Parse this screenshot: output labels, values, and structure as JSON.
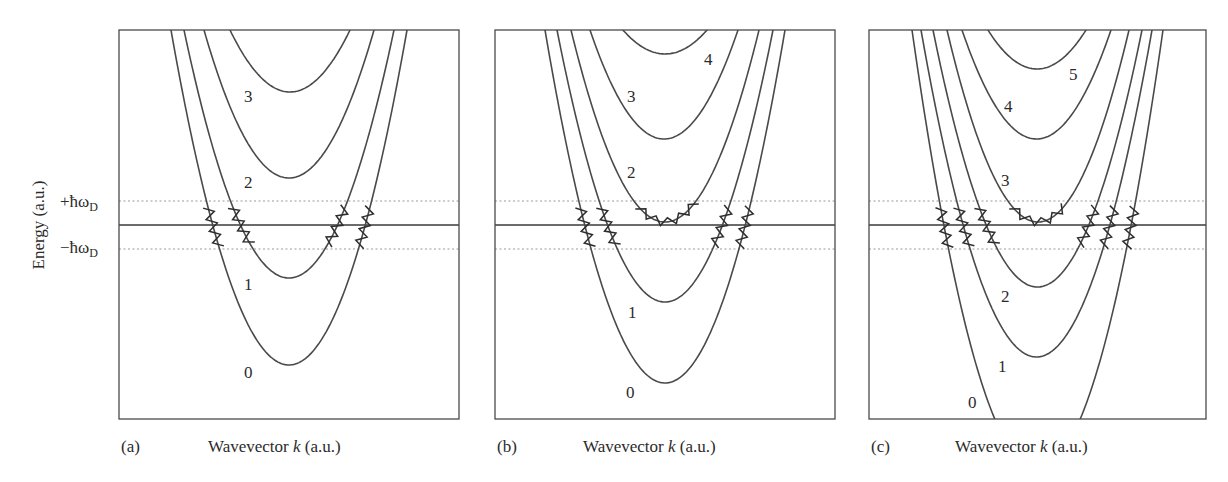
{
  "figure": {
    "ylabel": "Energy (a.u.)",
    "energy_marks": {
      "plus": "+ħω",
      "minus": "−ħω",
      "sub": "D"
    },
    "panels": [
      {
        "tag": "(a)",
        "xlabel_pre": "Wavevector ",
        "xlabel_k": "k",
        "xlabel_post": " (a.u.)"
      },
      {
        "tag": "(b)",
        "xlabel_pre": "Wavevector ",
        "xlabel_k": "k",
        "xlabel_post": " (a.u.)"
      },
      {
        "tag": "(c)",
        "xlabel_pre": "Wavevector ",
        "xlabel_k": "k",
        "xlabel_post": " (a.u.)"
      }
    ]
  },
  "colors": {
    "curve": "#4a4a4a",
    "frame": "#4a4a4a",
    "band": "#9a9a9a",
    "text": "#2b2b2b"
  },
  "chart_data": [
    {
      "type": "line",
      "panel": "(a)",
      "title": "",
      "xlabel": "Wavevector k (a.u.)",
      "ylabel": "Energy (a.u.)",
      "grid": false,
      "ytick_labels": [
        "+ħωD",
        "−ħωD"
      ],
      "reference_lines": {
        "fermi_level": 0,
        "debye_window": [
          "-ħωD",
          "+ħωD"
        ]
      },
      "series": [
        {
          "name": "0",
          "subband_index": 0,
          "min_energy_rel": -1.0
        },
        {
          "name": "1",
          "subband_index": 1,
          "min_energy_rel": -0.3
        },
        {
          "name": "2",
          "subband_index": 2,
          "min_energy_rel": 0.5
        },
        {
          "name": "3",
          "subband_index": 3,
          "min_energy_rel": 1.2
        }
      ],
      "geometry": {
        "frame": [
          119,
          30,
          459,
          419
        ],
        "cx": 289,
        "fermi_y": 225,
        "plus_y": 201,
        "minus_y": 249,
        "curves": [
          {
            "label": "0",
            "ymin": 365,
            "xl": 171,
            "xr": 407,
            "lx": 244,
            "ly": 378
          },
          {
            "label": "1",
            "ymin": 278,
            "xl": 184,
            "xr": 394,
            "lx": 244,
            "ly": 290
          },
          {
            "label": "2",
            "ymin": 178,
            "xl": 204,
            "xr": 374,
            "lx": 244,
            "ly": 188
          },
          {
            "label": "3",
            "ymin": 92,
            "xl": 230,
            "xr": 350,
            "lx": 244,
            "ly": 102
          }
        ],
        "zigzag_curves": [
          0,
          1
        ],
        "bottom_zigzag": null
      }
    },
    {
      "type": "line",
      "panel": "(b)",
      "title": "",
      "xlabel": "Wavevector k (a.u.)",
      "ylabel": "Energy (a.u.)",
      "grid": false,
      "reference_lines": {
        "fermi_level": 0,
        "debye_window": [
          "-ħωD",
          "+ħωD"
        ]
      },
      "series": [
        {
          "name": "0",
          "subband_index": 0
        },
        {
          "name": "1",
          "subband_index": 1
        },
        {
          "name": "2",
          "subband_index": 2,
          "minimum_in_debye_window": true
        },
        {
          "name": "3",
          "subband_index": 3
        },
        {
          "name": "4",
          "subband_index": 4
        }
      ],
      "geometry": {
        "frame": [
          495,
          30,
          835,
          419
        ],
        "cx": 667,
        "fermi_y": 225,
        "plus_y": 201,
        "minus_y": 249,
        "curves": [
          {
            "label": "0",
            "ymin": 383,
            "xl": 545,
            "xr": 785,
            "lx": 626,
            "ly": 398
          },
          {
            "label": "1",
            "ymin": 302,
            "xl": 557,
            "xr": 773,
            "lx": 628,
            "ly": 318
          },
          {
            "label": "2",
            "ymin": 222,
            "xl": 571,
            "xr": 759,
            "lx": 627,
            "ly": 178
          },
          {
            "label": "3",
            "ymin": 139,
            "xl": 590,
            "xr": 738,
            "lx": 627,
            "ly": 102
          },
          {
            "label": "4",
            "ymin": 54,
            "xl": 623,
            "xr": 707,
            "lx": 704,
            "ly": 65
          }
        ],
        "zigzag_curves": [
          0,
          1
        ],
        "bottom_zigzag": 2
      }
    },
    {
      "type": "line",
      "panel": "(c)",
      "title": "",
      "xlabel": "Wavevector k (a.u.)",
      "ylabel": "Energy (a.u.)",
      "grid": false,
      "reference_lines": {
        "fermi_level": 0,
        "debye_window": [
          "-ħωD",
          "+ħωD"
        ]
      },
      "series": [
        {
          "name": "0",
          "subband_index": 0
        },
        {
          "name": "1",
          "subband_index": 1
        },
        {
          "name": "2",
          "subband_index": 2
        },
        {
          "name": "3",
          "subband_index": 3,
          "minimum_in_debye_window": true
        },
        {
          "name": "4",
          "subband_index": 4
        },
        {
          "name": "5",
          "subband_index": 5
        }
      ],
      "geometry": {
        "frame": [
          869,
          30,
          1206,
          419
        ],
        "cx": 1036,
        "fermi_y": 225,
        "plus_y": 201,
        "minus_y": 249,
        "curves": [
          {
            "label": "0",
            "ymin": 470,
            "xl": 912,
            "xr": 1163,
            "lx": 968,
            "ly": 408
          },
          {
            "label": "1",
            "ymin": 357,
            "xl": 921,
            "xr": 1152,
            "lx": 998,
            "ly": 372
          },
          {
            "label": "2",
            "ymin": 287,
            "xl": 933,
            "xr": 1142,
            "lx": 1001,
            "ly": 302
          },
          {
            "label": "3",
            "ymin": 222,
            "xl": 947,
            "xr": 1129,
            "lx": 1001,
            "ly": 186
          },
          {
            "label": "4",
            "ymin": 139,
            "xl": 962,
            "xr": 1111,
            "lx": 1004,
            "ly": 112
          },
          {
            "label": "5",
            "ymin": 69,
            "xl": 988,
            "xr": 1086,
            "lx": 1069,
            "ly": 80
          }
        ],
        "zigzag_curves": [
          0,
          1,
          2
        ],
        "bottom_zigzag": 3
      }
    }
  ]
}
